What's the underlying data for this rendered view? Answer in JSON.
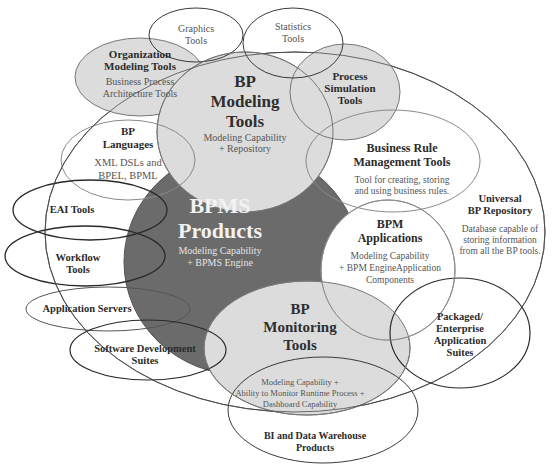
{
  "colors": {
    "background": "#ffffff",
    "dark_fill": "#6b6b6b",
    "light_fill": "#dcdcdc",
    "stroke_dark": "#3a3a3a",
    "stroke_light": "#8a8a8a"
  },
  "nodes": {
    "universal_repository": {
      "title_1": "Universal",
      "title_2": "BP Repository",
      "desc_1": "Database capable of",
      "desc_2": "storing information",
      "desc_3": "from all the BP tools."
    },
    "graphics_tools": {
      "title_1": "Graphics",
      "title_2": "Tools"
    },
    "statistics_tools": {
      "title_1": "Statistics",
      "title_2": "Tools"
    },
    "organization_modeling": {
      "title_1": "Organization",
      "title_2": "Modeling Tools",
      "desc_1": "Business Process",
      "desc_2": "Architecture Tools"
    },
    "bp_modeling": {
      "title_1": "BP",
      "title_2": "Modeling",
      "title_3": "Tools",
      "desc_1": "Modeling Capability",
      "desc_2": "+ Repository"
    },
    "process_simulation": {
      "title_1": "Process",
      "title_2": "Simulation",
      "title_3": "Tools"
    },
    "bp_languages": {
      "title_1": "BP",
      "title_2": "Languages",
      "desc_1": "XML DSLs and",
      "desc_2": "BPEL, BPML"
    },
    "business_rule": {
      "title_1": "Business Rule",
      "title_2": "Management Tools",
      "desc_1": "Tool for creating, storing",
      "desc_2": "and using business rules."
    },
    "eai_tools": {
      "title_1": "EAI Tools"
    },
    "bpms_products": {
      "title_1": "BPMS",
      "title_2": "Products",
      "desc_1": "Modeling Capability",
      "desc_2": "+ BPMS Engine"
    },
    "workflow_tools": {
      "title_1": "Workflow",
      "title_2": "Tools"
    },
    "bpm_applications": {
      "title_1": "BPM",
      "title_2": "Applications",
      "desc_1": "Modeling Capability",
      "desc_2": "+ BPM EngineApplication",
      "desc_3": "Components"
    },
    "application_servers": {
      "title_1": "Application Servers"
    },
    "packaged_suites": {
      "title_1": "Packaged/",
      "title_2": "Enterprise",
      "title_3": "Application",
      "title_4": "Suites"
    },
    "software_development": {
      "title_1": "Software Development",
      "title_2": "Suites"
    },
    "bp_monitoring": {
      "title_1": "BP",
      "title_2": "Monitoring",
      "title_3": "Tools",
      "desc_1": "Modeling Capability +",
      "desc_2": "Ability to Monitor Runtime Process +",
      "desc_3": "Dashboard Capability"
    },
    "bi_data_warehouse": {
      "title_1": "BI and Data Warehouse",
      "title_2": "Products"
    }
  }
}
